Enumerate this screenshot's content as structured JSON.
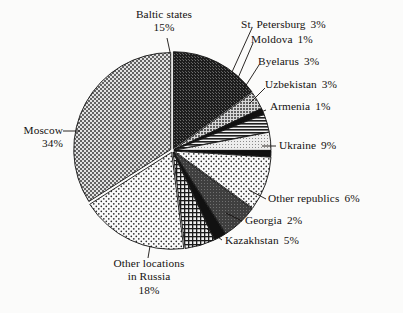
{
  "chart_data": {
    "type": "pie",
    "title": "",
    "subtitle": "",
    "xlabel": "",
    "ylabel": "",
    "legend_position": "none",
    "grid": false,
    "units": "percent",
    "total": 100,
    "start_angle_deg": 0,
    "direction": "clockwise",
    "categories": [
      "Baltic states",
      "St. Petersburg",
      "Moldova",
      "Byelarus",
      "Uzbekistan",
      "Armenia",
      "Ukraine",
      "Other republics",
      "Georgia",
      "Kazakhstan",
      "Other locations in Russia",
      "Moscow"
    ],
    "values": [
      15,
      3,
      1,
      3,
      3,
      1,
      9,
      6,
      2,
      5,
      18,
      34
    ],
    "slices": [
      {
        "label": "Baltic states",
        "value": 15,
        "pct_text": "15%",
        "fill": "dense-dark",
        "color": "#2b2b2b"
      },
      {
        "label": "St. Petersburg",
        "value": 3,
        "pct_text": "3%",
        "fill": "mid-gray",
        "color": "#8d8d8d"
      },
      {
        "label": "Moldova",
        "value": 1,
        "pct_text": "1%",
        "fill": "solid-black",
        "color": "#111111"
      },
      {
        "label": "Byelarus",
        "value": 3,
        "pct_text": "3%",
        "fill": "hlines",
        "color": "#3a3a3a"
      },
      {
        "label": "Uzbekistan",
        "value": 3,
        "pct_text": "3%",
        "fill": "light-gray",
        "color": "#c9c9c9"
      },
      {
        "label": "Armenia",
        "value": 1,
        "pct_text": "1%",
        "fill": "solid-black",
        "color": "#111111"
      },
      {
        "label": "Ukraine",
        "value": 9,
        "pct_text": "9%",
        "fill": "sparse-dots",
        "color": "#efefef"
      },
      {
        "label": "Other republics",
        "value": 6,
        "pct_text": "6%",
        "fill": "dark-gray",
        "color": "#4a4a4a"
      },
      {
        "label": "Georgia",
        "value": 2,
        "pct_text": "2%",
        "fill": "solid-black",
        "color": "#111111"
      },
      {
        "label": "Kazakhstan",
        "value": 5,
        "pct_text": "5%",
        "fill": "crosshatch",
        "color": "#3d3d3d"
      },
      {
        "label": "Other locations in Russia",
        "value": 18,
        "pct_text": "18%",
        "fill": "sparse-dots",
        "color": "#efefef"
      },
      {
        "label": "Moscow",
        "value": 34,
        "pct_text": "34%",
        "fill": "checker-gray",
        "color": "#9a9a9a"
      }
    ]
  },
  "labels": {
    "baltic": {
      "name": "Baltic states",
      "pct": "15%"
    },
    "petersburg": {
      "name": "St. Petersburg",
      "pct": "3%"
    },
    "moldova": {
      "name": "Moldova",
      "pct": "1%"
    },
    "byelarus": {
      "name": "Byelarus",
      "pct": "3%"
    },
    "uzbekistan": {
      "name": "Uzbekistan",
      "pct": "3%"
    },
    "armenia": {
      "name": "Armenia",
      "pct": "1%"
    },
    "ukraine": {
      "name": "Ukraine",
      "pct": "9%"
    },
    "other_reps": {
      "name": "Other republics",
      "pct": "6%"
    },
    "georgia": {
      "name": "Georgia",
      "pct": "2%"
    },
    "kazakhstan": {
      "name": "Kazakhstan",
      "pct": "5%"
    },
    "other_rus": {
      "line1": "Other locations",
      "line2": "in Russia",
      "pct": "18%"
    },
    "moscow": {
      "name": "Moscow",
      "pct": "34%"
    }
  },
  "style": {
    "background": "#fbfbfa",
    "ink": "#14110f",
    "outline": "#111111"
  }
}
